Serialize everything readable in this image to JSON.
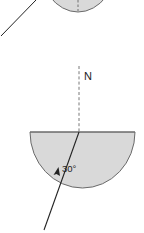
{
  "diagram": {
    "type": "optics-refraction",
    "colors": {
      "block_fill": "#d9d9d9",
      "block_stroke": "#555555",
      "ray": "#222222",
      "normal": "#555555"
    },
    "top_block": {
      "partial": true
    },
    "normal_label": "N",
    "angle_label": "30°",
    "angle_value_degrees": 30
  }
}
